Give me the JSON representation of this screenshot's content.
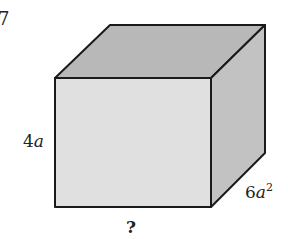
{
  "figure": {
    "problem_number_fragment": "7",
    "shape": "rectangular-prism",
    "labels": {
      "height": {
        "coef": "4",
        "var": "a"
      },
      "depth": {
        "coef": "6",
        "var": "a",
        "exp": "2"
      },
      "width": "?"
    },
    "colors": {
      "top_face": "#b8b8b8",
      "front_face": "#e0e0e0",
      "side_face": "#c2c2c2",
      "edge": "#1a1a1a"
    }
  }
}
